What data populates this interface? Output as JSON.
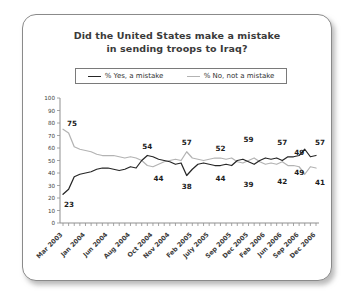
{
  "card": {
    "border_color": "#8a8a8a",
    "background": "#ffffff"
  },
  "chart_data": {
    "type": "line",
    "title": "Did the United States make a mistake in sending troops to Iraq?",
    "title_line1": "Did the United States make a mistake",
    "title_line2": "in sending troops to Iraq?",
    "xlabel": "",
    "ylabel": "",
    "ylim": [
      0,
      100
    ],
    "ytick_values": [
      0,
      10,
      20,
      30,
      40,
      50,
      60,
      70,
      80,
      90,
      100
    ],
    "ytick_labels": [
      "0",
      "10",
      "20",
      "30",
      "40",
      "50",
      "60",
      "70",
      "80",
      "90",
      "100"
    ],
    "grid": false,
    "legend_position": "top-center",
    "xtick_labels": [
      "Mar 2003",
      "Jan 2004",
      "Jun 2004",
      "Aug 2004",
      "Oct 2004",
      "Nov 2004",
      "Feb 2005",
      "July 2005",
      "Sep 2005",
      "Dec 2005",
      "Feb 2006",
      "Jun 2006",
      "Sep 2006",
      "Dec 2006"
    ],
    "xtick_positions": [
      0,
      4,
      8,
      12,
      16,
      19,
      23,
      26,
      30,
      33,
      36,
      39,
      42,
      45
    ],
    "n_points": 46,
    "series": [
      {
        "name": "% Yes, a mistake",
        "color": "#262626",
        "values": [
          23,
          27,
          37,
          39,
          40,
          41,
          43,
          44,
          44,
          43,
          42,
          43,
          45,
          44,
          50,
          54,
          53,
          51,
          50,
          49,
          47,
          48,
          38,
          43,
          47,
          48,
          47,
          46,
          46,
          47,
          46,
          50,
          51,
          49,
          47,
          50,
          52,
          51,
          52,
          50,
          53,
          53,
          54,
          59,
          53,
          54
        ]
      },
      {
        "name": "% No, not a mistake",
        "color": "#b3b3b3",
        "values": [
          75,
          72,
          61,
          59,
          58,
          57,
          55,
          54,
          54,
          54,
          53,
          52,
          53,
          52,
          50,
          46,
          45,
          47,
          49,
          50,
          51,
          50,
          57,
          52,
          51,
          50,
          51,
          52,
          52,
          51,
          52,
          49,
          48,
          50,
          52,
          49,
          47,
          48,
          47,
          49,
          46,
          46,
          45,
          39,
          45,
          44
        ]
      }
    ],
    "annotations": [
      {
        "text": "75",
        "series": "% No, not a mistake",
        "value": 75,
        "x_index": 0,
        "position": "right"
      },
      {
        "text": "23",
        "series": "% Yes, a mistake",
        "value": 23,
        "x_index": 0,
        "position": "below-right"
      },
      {
        "text": "54",
        "series": "% Yes, a mistake",
        "value": 54,
        "x_index": 15,
        "position": "above"
      },
      {
        "text": "44",
        "series": "% Yes, a mistake",
        "value": 44,
        "x_index": 17,
        "position": "below"
      },
      {
        "text": "57",
        "series": "% No, not a mistake",
        "value": 57,
        "x_index": 22,
        "position": "above"
      },
      {
        "text": "38",
        "series": "% Yes, a mistake",
        "value": 38,
        "x_index": 22,
        "position": "below"
      },
      {
        "text": "52",
        "series": "% No, not a mistake",
        "value": 52,
        "x_index": 28,
        "position": "above"
      },
      {
        "text": "44",
        "series": "% Yes, a mistake",
        "value": 44,
        "x_index": 28,
        "position": "below"
      },
      {
        "text": "59",
        "series": "% Yes, a mistake",
        "value": 59,
        "x_index": 33,
        "position": "above"
      },
      {
        "text": "39",
        "series": "% No, not a mistake",
        "value": 39,
        "x_index": 33,
        "position": "below"
      },
      {
        "text": "57",
        "series": "% Yes, a mistake",
        "value": 57,
        "x_index": 39,
        "position": "above"
      },
      {
        "text": "42",
        "series": "% No, not a mistake",
        "value": 42,
        "x_index": 39,
        "position": "below"
      },
      {
        "text": "49",
        "series": "% Yes, a mistake",
        "value": 49,
        "x_index": 42,
        "position": "above"
      },
      {
        "text": "49",
        "series": "% No, not a mistake",
        "value": 49,
        "x_index": 42,
        "position": "below"
      },
      {
        "text": "57",
        "series": "% Yes, a mistake",
        "value": 57,
        "x_index": 45,
        "position": "above"
      },
      {
        "text": "41",
        "series": "% No, not a mistake",
        "value": 41,
        "x_index": 45,
        "position": "below"
      }
    ]
  },
  "legend": {
    "items": [
      {
        "label": "% Yes, a mistake",
        "color": "#262626"
      },
      {
        "label": "% No, not a mistake",
        "color": "#b3b3b3"
      }
    ]
  }
}
